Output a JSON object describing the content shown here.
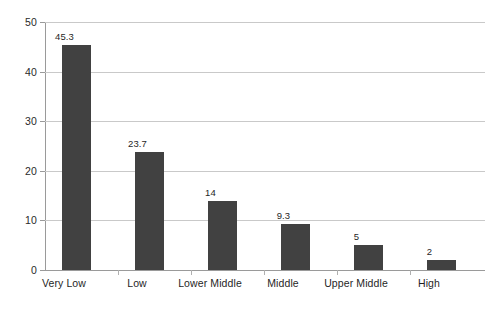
{
  "chart_data": {
    "type": "bar",
    "title": "",
    "subtitle": "",
    "xlabel": "",
    "ylabel": "",
    "categories": [
      "Very Low",
      "Low",
      "Lower Middle",
      "Middle",
      "Upper Middle",
      "High"
    ],
    "values": [
      45.3,
      23.7,
      14,
      9.3,
      5,
      2
    ],
    "value_labels": [
      "45.3",
      "23.7",
      "14",
      "9.3",
      "5",
      "2"
    ],
    "ylim": [
      0,
      50
    ],
    "ytick_labels": [
      "0",
      "10",
      "20",
      "30",
      "40",
      "50"
    ],
    "ytick_values": [
      0,
      10,
      20,
      30,
      40,
      50
    ],
    "grid": true,
    "grid_axis": "y",
    "legend": false,
    "legend_position": "none",
    "bar_color": "#414141",
    "gridline_color": "#c9c9c9",
    "axis_color": "#9a9a9a",
    "background_color": "#ffffff",
    "text_color": "#1f1f1f"
  }
}
